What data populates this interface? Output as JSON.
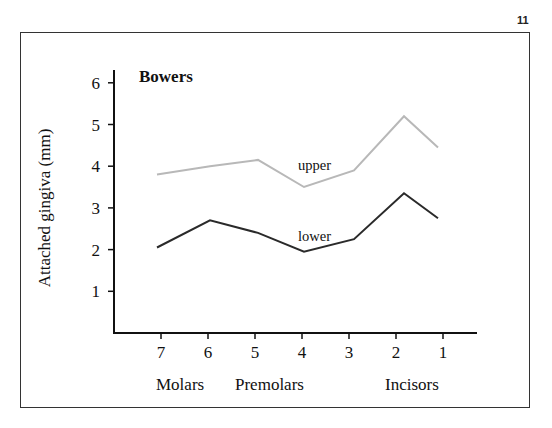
{
  "page": {
    "number": "11"
  },
  "chart_data": {
    "type": "line",
    "title": "Bowers",
    "xlabel": "",
    "ylabel": "Attached gingiva (mm)",
    "categories": [
      "7",
      "6",
      "5",
      "4",
      "3",
      "2",
      "1"
    ],
    "category_groups": [
      {
        "label": "Molars",
        "teeth": [
          "7",
          "6"
        ]
      },
      {
        "label": "Premolars",
        "teeth": [
          "5",
          "4"
        ]
      },
      {
        "label": "Incisors",
        "teeth": [
          "2",
          "1"
        ]
      }
    ],
    "yticks": [
      1,
      2,
      3,
      4,
      5,
      6
    ],
    "ylim": [
      0,
      6.3
    ],
    "grid": false,
    "legend": "inline labels",
    "series": [
      {
        "name": "upper",
        "color": "#b8b8b8",
        "values": [
          3.8,
          4.0,
          4.15,
          3.5,
          3.9,
          5.2,
          4.45
        ]
      },
      {
        "name": "lower",
        "color": "#2a2a2a",
        "values": [
          2.05,
          2.7,
          2.4,
          1.95,
          2.25,
          3.35,
          2.75
        ]
      }
    ]
  },
  "labels": {
    "title": "Bowers",
    "ylabel": "Attached gingiva (mm)",
    "upper": "upper",
    "lower": "lower",
    "molars": "Molars",
    "premolars": "Premolars",
    "incisors": "Incisors"
  }
}
